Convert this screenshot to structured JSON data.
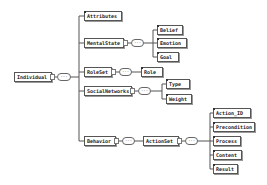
{
  "diagram": {
    "root": "Individual",
    "sequence_symbol": "···",
    "children": [
      {
        "label": "Attributes",
        "children": []
      },
      {
        "label": "MentalState",
        "children": [
          "Belief",
          "Emotion",
          "Goal"
        ]
      },
      {
        "label": "RoleSet",
        "children": [
          "Role"
        ]
      },
      {
        "label": "SocialNetworks",
        "children": [
          "Type",
          "Weight"
        ]
      },
      {
        "label": "Behavior",
        "children": [
          {
            "label": "ActionSet",
            "children": [
              "Action_ID",
              "Precondition",
              "Process",
              "Content",
              "Result"
            ]
          }
        ]
      }
    ]
  },
  "labels": {
    "individual": "Individual",
    "attributes": "Attributes",
    "mentalstate": "MentalState",
    "belief": "Belief",
    "emotion": "Emotion",
    "goal": "Goal",
    "roleset": "RoleSet",
    "role": "Role",
    "socialnetworks": "SocialNetworks",
    "type": "Type",
    "weight": "Weight",
    "behavior": "Behavior",
    "actionset": "ActionSet",
    "action_id": "Action_ID",
    "precondition": "Precondition",
    "process": "Process",
    "content": "Content",
    "result": "Result",
    "seq": "···"
  }
}
